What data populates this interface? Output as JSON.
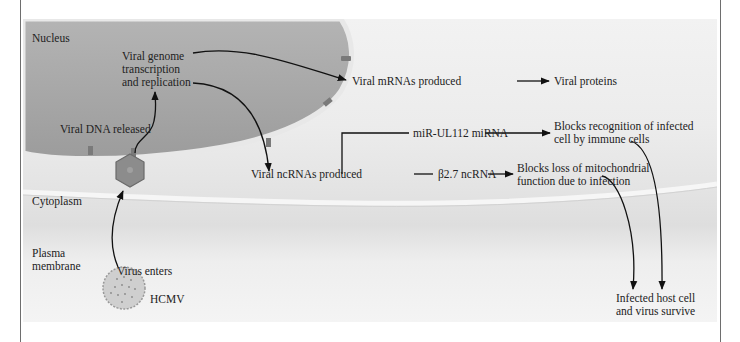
{
  "diagram": {
    "regions": {
      "nucleus": "Nucleus",
      "cytoplasm": "Cytoplasm",
      "plasma_membrane_line1": "Plasma",
      "plasma_membrane_line2": "membrane"
    },
    "virus": {
      "name": "HCMV",
      "enters": "Virus enters",
      "dna_released": "Viral DNA released"
    },
    "nodes": {
      "genome_line1": "Viral genome",
      "genome_line2": "transcription",
      "genome_line3": "and replication",
      "mrnas": "Viral mRNAs produced",
      "proteins": "Viral proteins",
      "ncrnas": "Viral ncRNAs produced",
      "mirna": "miR-UL112 miRNA",
      "b27": "β2.7 ncRNA",
      "blocks_recog_line1": "Blocks recognition of infected",
      "blocks_recog_line2": "cell by immune cells",
      "blocks_mito_line1": "Blocks loss of mitochondrial",
      "blocks_mito_line2": "function due to infection",
      "survive_line1": "Infected host cell",
      "survive_line2": "and virus survive"
    },
    "colors": {
      "nucleus_fill": "#a8a8a8",
      "nuclear_envelope": "#e6e6e6",
      "pore": "#7a7a7a",
      "capsid": "#8a8a8a",
      "arrow": "#111111"
    }
  }
}
